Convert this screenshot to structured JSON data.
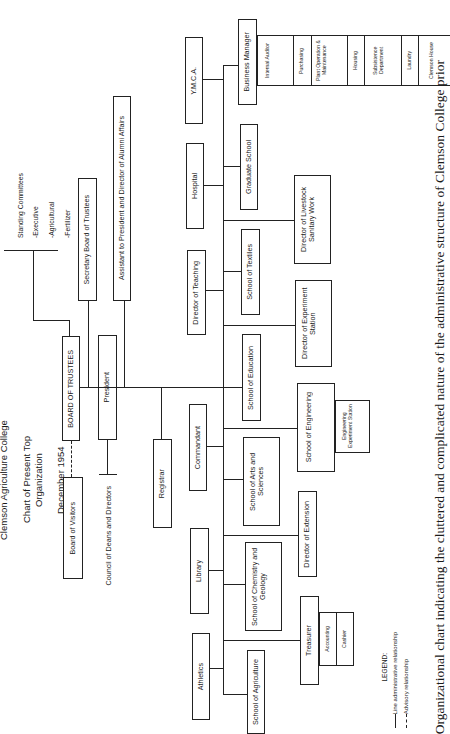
{
  "title": {
    "line1": "Clemson Agriculture College",
    "line2": "Chart of Present Top Organization",
    "line3": "December 1954"
  },
  "standing_committees": {
    "heading": "Standing Committees",
    "items": [
      "-Executive",
      "-Agricultural",
      "-Fertilizer",
      "-Finance"
    ]
  },
  "boards": {
    "board_of_trustees": "BOARD OF TRUSTEES",
    "board_of_visitors": "Board of Visitors",
    "secretary": "Secretary Board of Trustees",
    "president": "President",
    "assistant": "Assistant to President and Director of Alumni Affairs",
    "council": "Council of Deans and Directors",
    "registrar": "Registrar"
  },
  "left_column": [
    "Y.M.C.A.",
    "Hospital",
    "Director of Teaching",
    "Commandant",
    "Library",
    "Athletics"
  ],
  "right_column": [
    "Business Manager",
    "Graduate School",
    "School of Textiles",
    "School of Education",
    "School of Arts and Sciences",
    "School of Chemistry and Geology",
    "School of Agriculture"
  ],
  "far_right_column": {
    "livestock": "Director of Livestock Sanitary Work",
    "experiment_station": "Director of Experiment Station",
    "engineering": "School of Engineering",
    "engineering_station": "Engineering Experiment Station",
    "extension": "Director of Extension",
    "treasurer": "Treasurer",
    "accounting": "Accounting",
    "cashier": "Cashier"
  },
  "business_units": [
    "Internal Auditor",
    "Purchasing",
    "Plant Operation & Maintenance",
    "Housing",
    "Subsistence Department",
    "Laundry",
    "Clemson House"
  ],
  "legend": {
    "heading": "LEGEND:",
    "solid": "Line administrative relationship",
    "dashed": "Advisory relationship"
  },
  "caption": "Organizational chart indicating the cluttered and complicated nature of the administrative structure of Clemson College prior"
}
